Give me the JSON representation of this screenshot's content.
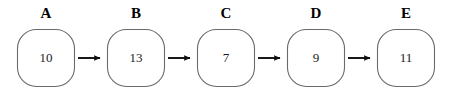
{
  "diagram": {
    "type": "linked-list",
    "background_color": "#ffffff",
    "node_border_color": "#6a6a6a",
    "node_fill_color": "#ffffff",
    "arrow_color": "#0d0d0d",
    "label_color": "#000000",
    "value_color": "#1a1a1a",
    "nodes": [
      {
        "label": "A",
        "value": "10",
        "cx": 46,
        "cy": 58
      },
      {
        "label": "B",
        "value": "13",
        "cx": 136,
        "cy": 58
      },
      {
        "label": "C",
        "value": "7",
        "cx": 226,
        "cy": 58
      },
      {
        "label": "D",
        "value": "9",
        "cx": 316,
        "cy": 58
      },
      {
        "label": "E",
        "value": "11",
        "cx": 406,
        "cy": 58
      }
    ],
    "edges": [
      {
        "from": "A",
        "to": "B",
        "arrow": "right"
      },
      {
        "from": "B",
        "to": "C",
        "arrow": "right"
      },
      {
        "from": "C",
        "to": "D",
        "arrow": "right"
      },
      {
        "from": "D",
        "to": "E",
        "arrow": "right"
      }
    ]
  }
}
